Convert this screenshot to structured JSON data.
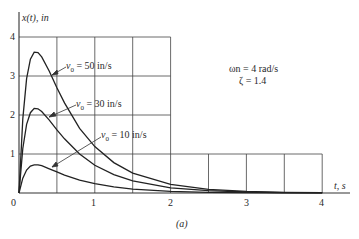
{
  "chart_data": {
    "type": "line",
    "title": "",
    "caption": "(a)",
    "xlabel": "t, s",
    "ylabel": "x(t), in",
    "xlim": [
      0,
      4
    ],
    "ylim": [
      0,
      4
    ],
    "xticks": [
      "0",
      "1",
      "2",
      "3",
      "4"
    ],
    "yticks": [
      "1",
      "2",
      "3",
      "4"
    ],
    "grid": true,
    "annotation": {
      "line1": "ωn = 4 rad/s",
      "line2": "ζ = 1.4"
    },
    "x": [
      0,
      0.05,
      0.1,
      0.15,
      0.2,
      0.25,
      0.3,
      0.4,
      0.5,
      0.6,
      0.8,
      1.0,
      1.25,
      1.5,
      2.0,
      2.5,
      3.0,
      3.5,
      4.0
    ],
    "series": [
      {
        "name": "v0 = 50 in/s",
        "label": "= 50 in/s",
        "values": [
          0,
          1.9,
          2.93,
          3.43,
          3.61,
          3.6,
          3.49,
          3.12,
          2.7,
          2.31,
          1.66,
          1.19,
          0.78,
          0.51,
          0.22,
          0.096,
          0.041,
          0.018,
          0.008
        ]
      },
      {
        "name": "v0 = 30 in/s",
        "label": "= 30 in/s",
        "values": [
          0,
          1.14,
          1.76,
          2.06,
          2.17,
          2.16,
          2.09,
          1.87,
          1.62,
          1.39,
          1.0,
          0.71,
          0.47,
          0.31,
          0.13,
          0.058,
          0.025,
          0.011,
          0.005
        ]
      },
      {
        "name": "v0 = 10 in/s",
        "label": "= 10 in/s",
        "values": [
          0,
          0.38,
          0.59,
          0.69,
          0.72,
          0.72,
          0.7,
          0.62,
          0.54,
          0.46,
          0.33,
          0.24,
          0.16,
          0.1,
          0.044,
          0.019,
          0.008,
          0.004,
          0.002
        ]
      }
    ]
  }
}
